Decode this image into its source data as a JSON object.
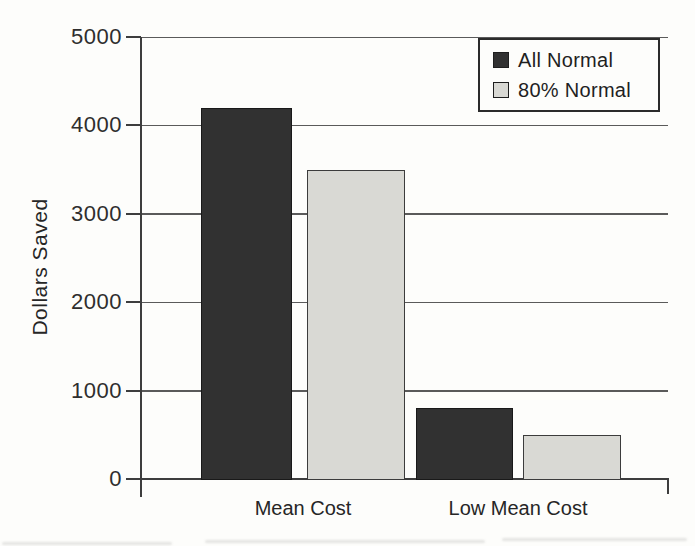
{
  "chart_data": {
    "type": "bar",
    "title": "",
    "xlabel": "",
    "ylabel": "Dollars Saved",
    "categories": [
      "Mean Cost",
      "Low Mean Cost"
    ],
    "series": [
      {
        "name": "All Normal",
        "color": "#313131",
        "values": [
          4200,
          800
        ]
      },
      {
        "name": "80% Normal",
        "color": "#d9d9d4",
        "values": [
          3500,
          500
        ]
      }
    ],
    "ylim": [
      0,
      5000
    ],
    "yticks": [
      0,
      1000,
      2000,
      3000,
      4000,
      5000
    ],
    "grid": true,
    "legend_position": "top-right",
    "legend_items": [
      {
        "label": "All Normal",
        "swatch_color": "#313131"
      },
      {
        "label": "80% Normal",
        "swatch_color": "#d9d9d4"
      }
    ],
    "axis_color": "#3d3d3d",
    "background_color": "#fdfdfb"
  }
}
